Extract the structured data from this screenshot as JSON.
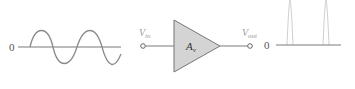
{
  "diagram": {
    "input_signal": {
      "zero_label": "0",
      "waveform": "sine"
    },
    "input_terminal": {
      "label_main": "V",
      "label_sub": "in"
    },
    "amplifier": {
      "label_main": "A",
      "label_sub": "v"
    },
    "output_terminal": {
      "label_main": "V",
      "label_sub": "out"
    },
    "output_signal": {
      "zero_label": "0",
      "waveform": "pulse-spikes"
    },
    "colors": {
      "line": "#7a7a7a",
      "amplifier_fill": "#d4d4d4",
      "amplifier_stroke": "#777777",
      "spike": "#cfcfcf"
    }
  }
}
